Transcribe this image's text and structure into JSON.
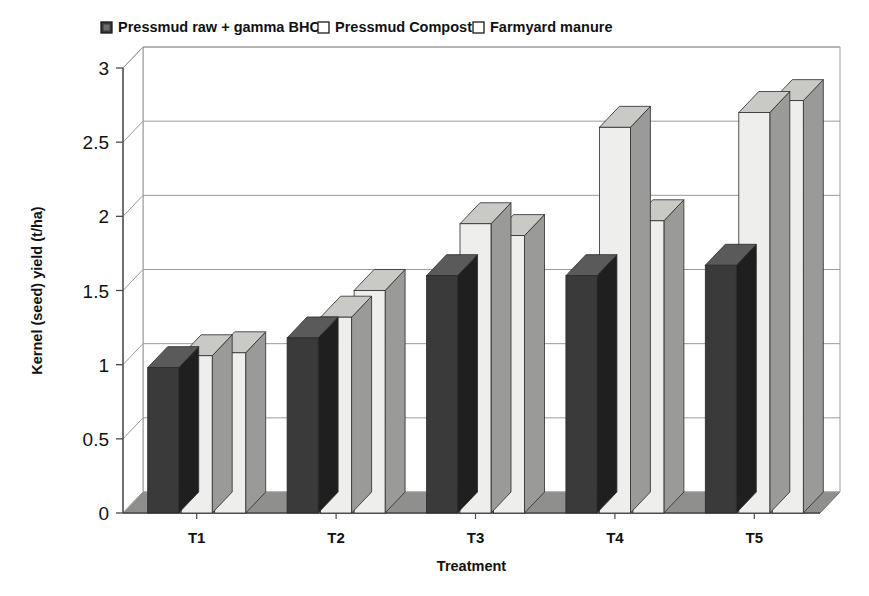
{
  "chart_data": {
    "type": "bar",
    "title": "",
    "subtitle": "",
    "xlabel": "Treatment",
    "ylabel": "Kernel (seed) yield (t/ha)",
    "categories": [
      "T1",
      "T2",
      "T3",
      "T4",
      "T5"
    ],
    "series": [
      {
        "name": "Pressmud raw + gamma BHC",
        "color": "#3a3a3a",
        "values": [
          0.98,
          1.18,
          1.6,
          1.6,
          1.67
        ]
      },
      {
        "name": "Pressmud Compost",
        "color": "#eeeeec",
        "values": [
          1.06,
          1.32,
          1.95,
          2.6,
          2.7
        ]
      },
      {
        "name": "Farmyard manure",
        "color": "#eeeeec",
        "values": [
          1.08,
          1.5,
          1.87,
          1.97,
          2.78
        ]
      }
    ],
    "ylim": [
      0,
      3
    ],
    "ytick_step": 0.5,
    "yticks": [
      "0",
      "0.5",
      "1",
      "1.5",
      "2",
      "2.5",
      "3"
    ],
    "grid": true,
    "legend_position": "top",
    "style": "3d-column"
  },
  "legend": {
    "items": [
      {
        "label": "Pressmud raw + gamma BHC",
        "swatch": "dark-filled-square"
      },
      {
        "label": "Pressmud Compost",
        "swatch": "light-outlined-square"
      },
      {
        "label": "Farmyard manure",
        "swatch": "light-outlined-square"
      }
    ]
  },
  "colors": {
    "series_dark": "#3a3a3a",
    "series_light": "#eeeeec",
    "side_dark": "#1f1f1f",
    "side_light": "#9a9a98",
    "top_dark": "#5a5a5a",
    "top_light": "#c9c9c6",
    "floor": "#8f8f8d",
    "grid": "#9b9b9b",
    "axis": "#4a4a4a",
    "background": "#ffffff"
  }
}
